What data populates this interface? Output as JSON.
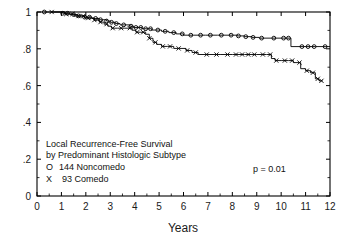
{
  "figure": {
    "border_color": "#000000",
    "background": "#ffffff"
  },
  "chart_data": {
    "type": "line",
    "title": "",
    "subtitle": "",
    "xlabel": "Years",
    "ylabel": "",
    "xlim": [
      0,
      12
    ],
    "ylim": [
      0,
      1
    ],
    "grid": false,
    "legend_position": "lower-left-inside",
    "xticks": [
      0,
      1,
      2,
      3,
      4,
      5,
      6,
      7,
      8,
      9,
      10,
      11,
      12
    ],
    "xticklabels": [
      "0",
      "1",
      "2",
      "3",
      "4",
      "5",
      "6",
      "7",
      "8",
      "9",
      "10",
      "11",
      "12"
    ],
    "yticks": [
      0,
      0.2,
      0.4,
      0.6,
      0.8,
      1
    ],
    "yticklabels": [
      "0",
      ".2",
      ".4",
      ".6",
      ".8",
      "1"
    ],
    "y_minor_ticks": [
      0.1,
      0.3,
      0.5,
      0.7,
      0.9
    ],
    "annotations": [
      "Local Recurrence-Free Survival",
      "by Predominant Histologic Subtype",
      "p = 0.01"
    ],
    "series": [
      {
        "name": "144 Noncomedo",
        "marker": "O",
        "n": 144,
        "censor_marker": "o",
        "points": [
          [
            0.3,
            1.0
          ],
          [
            0.45,
            1.0
          ],
          [
            1.0,
            1.0
          ],
          [
            1.05,
            0.993
          ],
          [
            1.2,
            0.993
          ],
          [
            1.35,
            0.986
          ],
          [
            1.5,
            0.986
          ],
          [
            1.65,
            0.979
          ],
          [
            1.8,
            0.979
          ],
          [
            1.95,
            0.972
          ],
          [
            2.1,
            0.972
          ],
          [
            2.25,
            0.965
          ],
          [
            2.4,
            0.965
          ],
          [
            2.55,
            0.958
          ],
          [
            2.7,
            0.958
          ],
          [
            2.85,
            0.951
          ],
          [
            3.0,
            0.944
          ],
          [
            3.2,
            0.937
          ],
          [
            3.4,
            0.93
          ],
          [
            3.6,
            0.93
          ],
          [
            3.8,
            0.923
          ],
          [
            3.95,
            0.916
          ],
          [
            4.1,
            0.916
          ],
          [
            4.3,
            0.909
          ],
          [
            4.5,
            0.909
          ],
          [
            4.7,
            0.902
          ],
          [
            4.9,
            0.902
          ],
          [
            5.1,
            0.895
          ],
          [
            5.4,
            0.888
          ],
          [
            5.7,
            0.881
          ],
          [
            6.0,
            0.874
          ],
          [
            6.4,
            0.874
          ],
          [
            6.9,
            0.874
          ],
          [
            7.4,
            0.874
          ],
          [
            7.9,
            0.874
          ],
          [
            8.2,
            0.87
          ],
          [
            8.5,
            0.866
          ],
          [
            8.8,
            0.862
          ],
          [
            9.1,
            0.858
          ],
          [
            9.6,
            0.858
          ],
          [
            10.1,
            0.858
          ],
          [
            10.35,
            0.858
          ],
          [
            10.4,
            0.812
          ],
          [
            10.9,
            0.812
          ],
          [
            11.4,
            0.812
          ],
          [
            11.8,
            0.812
          ],
          [
            12.0,
            0.812
          ]
        ],
        "censor_x": [
          0.3,
          1.05,
          1.25,
          1.5,
          1.7,
          1.95,
          2.15,
          2.4,
          2.6,
          2.85,
          3.05,
          3.25,
          3.55,
          3.85,
          4.05,
          4.25,
          4.45,
          4.65,
          4.95,
          5.25,
          5.6,
          5.95,
          6.3,
          6.7,
          7.1,
          7.55,
          7.95,
          8.25,
          8.55,
          8.85,
          9.2,
          9.7,
          10.1,
          10.3,
          10.85,
          11.1,
          11.35,
          11.8
        ]
      },
      {
        "name": "93 Comedo",
        "marker": "X",
        "n": 93,
        "censor_marker": "x",
        "points": [
          [
            0.6,
            1.0
          ],
          [
            1.0,
            1.0
          ],
          [
            1.15,
            0.989
          ],
          [
            1.35,
            0.989
          ],
          [
            1.55,
            0.978
          ],
          [
            1.75,
            0.978
          ],
          [
            1.95,
            0.967
          ],
          [
            2.15,
            0.967
          ],
          [
            2.35,
            0.956
          ],
          [
            2.55,
            0.945
          ],
          [
            2.75,
            0.934
          ],
          [
            2.9,
            0.923
          ],
          [
            3.05,
            0.912
          ],
          [
            3.3,
            0.912
          ],
          [
            3.6,
            0.912
          ],
          [
            3.9,
            0.901
          ],
          [
            4.05,
            0.89
          ],
          [
            4.25,
            0.89
          ],
          [
            4.45,
            0.879
          ],
          [
            4.6,
            0.857
          ],
          [
            4.75,
            0.835
          ],
          [
            4.9,
            0.824
          ],
          [
            5.1,
            0.813
          ],
          [
            5.35,
            0.813
          ],
          [
            5.6,
            0.802
          ],
          [
            5.85,
            0.802
          ],
          [
            6.1,
            0.791
          ],
          [
            6.35,
            0.78
          ],
          [
            6.6,
            0.769
          ],
          [
            7.0,
            0.769
          ],
          [
            7.5,
            0.769
          ],
          [
            8.0,
            0.769
          ],
          [
            8.5,
            0.769
          ],
          [
            9.0,
            0.769
          ],
          [
            9.4,
            0.769
          ],
          [
            9.6,
            0.747
          ],
          [
            9.75,
            0.736
          ],
          [
            10.0,
            0.736
          ],
          [
            10.3,
            0.736
          ],
          [
            10.5,
            0.725
          ],
          [
            10.8,
            0.692
          ],
          [
            11.0,
            0.681
          ],
          [
            11.2,
            0.67
          ],
          [
            11.4,
            0.637
          ],
          [
            11.55,
            0.626
          ],
          [
            11.7,
            0.626
          ]
        ],
        "censor_x": [
          0.6,
          1.2,
          1.45,
          1.7,
          1.9,
          2.1,
          2.35,
          2.6,
          2.85,
          3.1,
          3.45,
          3.8,
          4.1,
          4.35,
          4.6,
          4.85,
          5.15,
          5.45,
          5.8,
          6.15,
          6.5,
          6.95,
          7.35,
          7.8,
          8.15,
          8.4,
          8.65,
          8.9,
          9.25,
          9.55,
          9.8,
          10.15,
          10.45,
          10.75,
          11.05,
          11.3,
          11.5,
          11.65
        ]
      }
    ]
  },
  "legend": {
    "line1": "Local Recurrence-Free Survival",
    "line2": "by Predominant Histologic Subtype",
    "entry1_symbol": "O",
    "entry1_label": "144 Noncomedo",
    "entry2_symbol": "X",
    "entry2_label": "93 Comedo",
    "pvalue": "p = 0.01"
  }
}
